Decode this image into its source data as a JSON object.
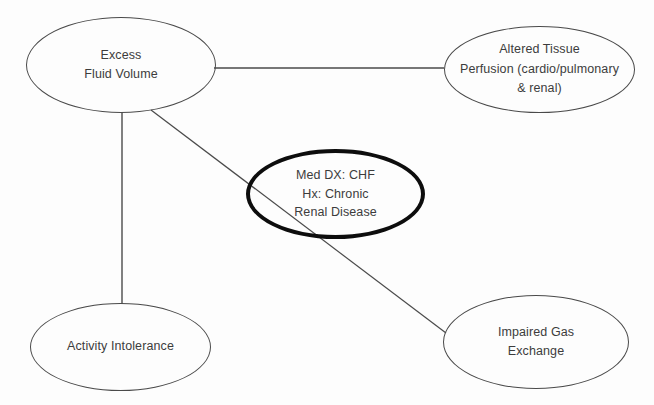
{
  "diagram": {
    "type": "concept-map",
    "background_color": "#fdfdfd",
    "line_color": "#4a4a4a",
    "text_color": "#3c3c3c",
    "focus_border_color": "#0d0d0d",
    "nodes": [
      {
        "id": "excess",
        "label": "Excess\nFluid Volume",
        "emphasis": "normal"
      },
      {
        "id": "perfusion",
        "label": "Altered Tissue\nPerfusion (cardio/pulmonary\n& renal)",
        "emphasis": "normal"
      },
      {
        "id": "focus",
        "label": "Med DX: CHF\nHx: Chronic\nRenal Disease",
        "emphasis": "bold"
      },
      {
        "id": "activity",
        "label": "Activity Intolerance",
        "emphasis": "normal"
      },
      {
        "id": "gas",
        "label": "Impaired Gas\nExchange",
        "emphasis": "normal"
      }
    ],
    "edges": [
      {
        "id": "excess-perfusion",
        "from": "excess",
        "to": "perfusion",
        "style": "straight"
      },
      {
        "id": "excess-activity",
        "from": "excess",
        "to": "activity",
        "style": "straight"
      },
      {
        "id": "excess-gas",
        "from": "excess",
        "to": "gas",
        "style": "straight"
      }
    ]
  }
}
